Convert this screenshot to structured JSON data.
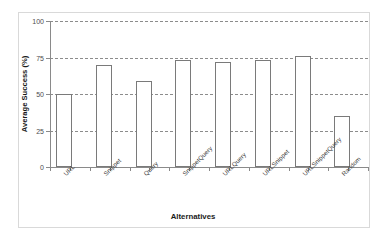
{
  "chart_data": {
    "type": "bar",
    "title": "",
    "xlabel": "Alternatives",
    "ylabel": "Average Success (%)",
    "categories": [
      "URL",
      "Snippet",
      "Query",
      "SnippetQuery",
      "URLQuery",
      "URLSnippet",
      "URLSnippetQuery",
      "Random"
    ],
    "values": [
      50,
      70,
      59,
      73,
      72,
      73,
      76,
      35
    ],
    "ylim": [
      0,
      100
    ],
    "yticks": [
      0,
      25,
      50,
      75,
      100
    ],
    "ytick_labels": [
      "0",
      "25",
      "50",
      "75",
      "100"
    ],
    "grid": "horizontal-dashed",
    "legend": "none",
    "bar_style": {
      "fill": "#ffffff",
      "edge": "#7a7a7a"
    },
    "axis_color": "#8a8a8a",
    "gridline_color": "#8c8c8c",
    "background": "#ffffff"
  }
}
